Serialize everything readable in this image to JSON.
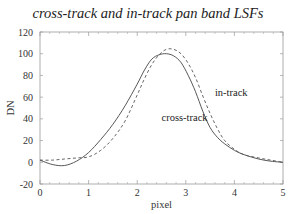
{
  "chart_data": {
    "type": "line",
    "title": "cross-track and in-track pan band LSFs",
    "xlabel": "pixel",
    "ylabel": "DN",
    "xlim": [
      0,
      5
    ],
    "ylim": [
      -20,
      120
    ],
    "x_ticks": [
      0,
      1,
      2,
      3,
      4,
      5
    ],
    "y_ticks": [
      -20,
      0,
      20,
      40,
      60,
      80,
      100,
      120
    ],
    "grid": false,
    "legend": "inline labels",
    "series": [
      {
        "name": "cross-track",
        "style": "solid",
        "x": [
          0,
          0.25,
          0.5,
          0.75,
          1.0,
          1.25,
          1.5,
          1.75,
          2.0,
          2.15,
          2.3,
          2.45,
          2.6,
          2.75,
          2.9,
          3.05,
          3.2,
          3.35,
          3.5,
          3.65,
          3.8,
          4.0,
          4.2,
          4.5,
          4.75,
          5.0
        ],
        "values": [
          2,
          -2,
          -3,
          1,
          9,
          21,
          35,
          52,
          72,
          85,
          95,
          99,
          100,
          98,
          92,
          80,
          65,
          47,
          32,
          23,
          17,
          11,
          7,
          3,
          1,
          0
        ]
      },
      {
        "name": "in-track",
        "style": "dashed",
        "x": [
          0,
          0.25,
          0.5,
          0.75,
          1.0,
          1.25,
          1.5,
          1.75,
          2.0,
          2.15,
          2.3,
          2.45,
          2.6,
          2.75,
          2.9,
          3.05,
          3.2,
          3.35,
          3.5,
          3.65,
          3.8,
          4.0,
          4.2,
          4.5,
          4.75,
          5.0
        ],
        "values": [
          2,
          2,
          3,
          4,
          5,
          11,
          22,
          38,
          62,
          77,
          90,
          99,
          104,
          104,
          100,
          91,
          78,
          61,
          45,
          31,
          20,
          12,
          7,
          4,
          2,
          0
        ]
      }
    ],
    "annotations": [
      {
        "text": "in-track",
        "x": 3.6,
        "y": 61
      },
      {
        "text": "cross-track",
        "x": 2.5,
        "y": 38
      }
    ]
  }
}
